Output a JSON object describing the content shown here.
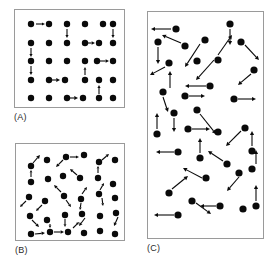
{
  "figure": {
    "kind": "vector-field-point-pattern-figure",
    "background_color": "#ffffff",
    "dot_color": "#0a0a0a",
    "arrow_color": "#0a0a0a",
    "border_color": "#9a9a9a",
    "width": 274,
    "height": 268
  },
  "panels": [
    {
      "id": "A",
      "label": "(A)",
      "name": "panel-a-regular-lattice",
      "frame": {
        "x": 14,
        "y": 9,
        "w": 111,
        "h": 99
      },
      "label_pos": {
        "x": 14,
        "y": 112
      },
      "description": "regular square lattice of points with short axis-aligned arrows",
      "dot_radius": 3.2,
      "arrow_stroke": 1.1,
      "points": [
        {
          "x": 16,
          "y": 14
        },
        {
          "x": 34,
          "y": 14
        },
        {
          "x": 52,
          "y": 14
        },
        {
          "x": 70,
          "y": 14
        },
        {
          "x": 88,
          "y": 14
        },
        {
          "x": 98,
          "y": 14
        },
        {
          "x": 16,
          "y": 33
        },
        {
          "x": 34,
          "y": 33
        },
        {
          "x": 52,
          "y": 33
        },
        {
          "x": 70,
          "y": 33
        },
        {
          "x": 84,
          "y": 33
        },
        {
          "x": 98,
          "y": 33
        },
        {
          "x": 16,
          "y": 51
        },
        {
          "x": 34,
          "y": 51
        },
        {
          "x": 52,
          "y": 51
        },
        {
          "x": 70,
          "y": 51
        },
        {
          "x": 82,
          "y": 51
        },
        {
          "x": 98,
          "y": 51
        },
        {
          "x": 16,
          "y": 70
        },
        {
          "x": 34,
          "y": 70
        },
        {
          "x": 50,
          "y": 70
        },
        {
          "x": 70,
          "y": 70
        },
        {
          "x": 84,
          "y": 70
        },
        {
          "x": 98,
          "y": 70
        },
        {
          "x": 16,
          "y": 88
        },
        {
          "x": 34,
          "y": 88
        },
        {
          "x": 52,
          "y": 88
        },
        {
          "x": 68,
          "y": 88
        },
        {
          "x": 84,
          "y": 88
        },
        {
          "x": 98,
          "y": 88
        }
      ],
      "arrows": [
        {
          "x1": 21,
          "y1": 14,
          "x2": 30,
          "y2": 14
        },
        {
          "x1": 52,
          "y1": 19,
          "x2": 52,
          "y2": 28
        },
        {
          "x1": 98,
          "y1": 19,
          "x2": 98,
          "y2": 28
        },
        {
          "x1": 70,
          "y1": 33,
          "x2": 80,
          "y2": 33
        },
        {
          "x1": 16,
          "y1": 38,
          "x2": 16,
          "y2": 47
        },
        {
          "x1": 84,
          "y1": 51,
          "x2": 94,
          "y2": 51
        },
        {
          "x1": 16,
          "y1": 56,
          "x2": 16,
          "y2": 65
        },
        {
          "x1": 70,
          "y1": 65,
          "x2": 70,
          "y2": 57
        },
        {
          "x1": 34,
          "y1": 70,
          "x2": 45,
          "y2": 70
        },
        {
          "x1": 84,
          "y1": 84,
          "x2": 84,
          "y2": 75
        },
        {
          "x1": 52,
          "y1": 88,
          "x2": 63,
          "y2": 88
        }
      ]
    },
    {
      "id": "B",
      "label": "(B)",
      "name": "panel-b-perturbed-lattice",
      "frame": {
        "x": 15,
        "y": 143,
        "w": 110,
        "h": 98
      },
      "label_pos": {
        "x": 15,
        "y": 245
      },
      "description": "jittered lattice of points with short arrows at varied angles",
      "dot_radius": 3.2,
      "arrow_stroke": 1.1,
      "points": [
        {
          "x": 15,
          "y": 22
        },
        {
          "x": 31,
          "y": 16
        },
        {
          "x": 50,
          "y": 13
        },
        {
          "x": 68,
          "y": 11
        },
        {
          "x": 83,
          "y": 18
        },
        {
          "x": 99,
          "y": 16
        },
        {
          "x": 15,
          "y": 38
        },
        {
          "x": 32,
          "y": 35
        },
        {
          "x": 47,
          "y": 32
        },
        {
          "x": 64,
          "y": 34
        },
        {
          "x": 82,
          "y": 34
        },
        {
          "x": 97,
          "y": 40
        },
        {
          "x": 13,
          "y": 53
        },
        {
          "x": 29,
          "y": 57
        },
        {
          "x": 48,
          "y": 52
        },
        {
          "x": 65,
          "y": 55
        },
        {
          "x": 83,
          "y": 50
        },
        {
          "x": 99,
          "y": 54
        },
        {
          "x": 14,
          "y": 72
        },
        {
          "x": 31,
          "y": 76
        },
        {
          "x": 49,
          "y": 71
        },
        {
          "x": 66,
          "y": 70
        },
        {
          "x": 84,
          "y": 72
        },
        {
          "x": 100,
          "y": 69
        },
        {
          "x": 15,
          "y": 90
        },
        {
          "x": 34,
          "y": 88
        },
        {
          "x": 52,
          "y": 88
        },
        {
          "x": 68,
          "y": 89
        },
        {
          "x": 84,
          "y": 87
        },
        {
          "x": 99,
          "y": 90
        }
      ],
      "arrows": [
        {
          "x1": 17,
          "y1": 19,
          "x2": 24,
          "y2": 11
        },
        {
          "x1": 47,
          "y1": 16,
          "x2": 40,
          "y2": 23
        },
        {
          "x1": 54,
          "y1": 13,
          "x2": 63,
          "y2": 13
        },
        {
          "x1": 86,
          "y1": 16,
          "x2": 93,
          "y2": 10
        },
        {
          "x1": 15,
          "y1": 33,
          "x2": 15,
          "y2": 26
        },
        {
          "x1": 61,
          "y1": 31,
          "x2": 54,
          "y2": 25
        },
        {
          "x1": 82,
          "y1": 29,
          "x2": 82,
          "y2": 22
        },
        {
          "x1": 45,
          "y1": 48,
          "x2": 38,
          "y2": 41
        },
        {
          "x1": 66,
          "y1": 50,
          "x2": 71,
          "y2": 43
        },
        {
          "x1": 10,
          "y1": 57,
          "x2": 4,
          "y2": 63
        },
        {
          "x1": 84,
          "y1": 46,
          "x2": 88,
          "y2": 39
        },
        {
          "x1": 26,
          "y1": 61,
          "x2": 20,
          "y2": 67
        },
        {
          "x1": 50,
          "y1": 56,
          "x2": 55,
          "y2": 63
        },
        {
          "x1": 65,
          "y1": 59,
          "x2": 64,
          "y2": 66
        },
        {
          "x1": 86,
          "y1": 54,
          "x2": 87,
          "y2": 62
        },
        {
          "x1": 16,
          "y1": 76,
          "x2": 23,
          "y2": 83
        },
        {
          "x1": 34,
          "y1": 80,
          "x2": 34,
          "y2": 84
        },
        {
          "x1": 49,
          "y1": 75,
          "x2": 49,
          "y2": 83
        },
        {
          "x1": 69,
          "y1": 74,
          "x2": 63,
          "y2": 82
        },
        {
          "x1": 102,
          "y1": 73,
          "x2": 98,
          "y2": 82
        },
        {
          "x1": 19,
          "y1": 90,
          "x2": 29,
          "y2": 89
        },
        {
          "x1": 38,
          "y1": 88,
          "x2": 48,
          "y2": 88
        },
        {
          "x1": 57,
          "y1": 84,
          "x2": 63,
          "y2": 78
        }
      ]
    },
    {
      "id": "C",
      "label": "(C)",
      "name": "panel-c-random-pattern",
      "frame": {
        "x": 147,
        "y": 11,
        "w": 117,
        "h": 228
      },
      "label_pos": {
        "x": 147,
        "y": 243
      },
      "description": "completely random (Poisson) point pattern with long arrows at random orientations",
      "dot_radius": 3.6,
      "arrow_stroke": 1.1,
      "points": [
        {
          "x": 28,
          "y": 17
        },
        {
          "x": 82,
          "y": 12
        },
        {
          "x": 10,
          "y": 30
        },
        {
          "x": 57,
          "y": 28
        },
        {
          "x": 37,
          "y": 34
        },
        {
          "x": 93,
          "y": 30
        },
        {
          "x": 21,
          "y": 51
        },
        {
          "x": 49,
          "y": 49
        },
        {
          "x": 70,
          "y": 48
        },
        {
          "x": 106,
          "y": 58
        },
        {
          "x": 15,
          "y": 80
        },
        {
          "x": 62,
          "y": 74
        },
        {
          "x": 37,
          "y": 84
        },
        {
          "x": 86,
          "y": 87
        },
        {
          "x": 26,
          "y": 101
        },
        {
          "x": 49,
          "y": 98
        },
        {
          "x": 9,
          "y": 122
        },
        {
          "x": 40,
          "y": 117
        },
        {
          "x": 70,
          "y": 120
        },
        {
          "x": 97,
          "y": 116
        },
        {
          "x": 30,
          "y": 140
        },
        {
          "x": 104,
          "y": 139
        },
        {
          "x": 52,
          "y": 146
        },
        {
          "x": 79,
          "y": 152
        },
        {
          "x": 58,
          "y": 166
        },
        {
          "x": 91,
          "y": 161
        },
        {
          "x": 104,
          "y": 157
        },
        {
          "x": 21,
          "y": 181
        },
        {
          "x": 44,
          "y": 189
        },
        {
          "x": 72,
          "y": 194
        },
        {
          "x": 95,
          "y": 197
        },
        {
          "x": 108,
          "y": 194
        },
        {
          "x": 30,
          "y": 203
        }
      ],
      "arrows": [
        {
          "x1": 23,
          "y1": 17,
          "x2": 3,
          "y2": 17
        },
        {
          "x1": 82,
          "y1": 17,
          "x2": 82,
          "y2": 33
        },
        {
          "x1": 33,
          "y1": 31,
          "x2": 14,
          "y2": 23
        },
        {
          "x1": 70,
          "y1": 43,
          "x2": 84,
          "y2": 23
        },
        {
          "x1": 10,
          "y1": 35,
          "x2": 10,
          "y2": 52
        },
        {
          "x1": 97,
          "y1": 33,
          "x2": 111,
          "y2": 48
        },
        {
          "x1": 52,
          "y1": 32,
          "x2": 37,
          "y2": 55
        },
        {
          "x1": 17,
          "y1": 55,
          "x2": 2,
          "y2": 63
        },
        {
          "x1": 66,
          "y1": 48,
          "x2": 48,
          "y2": 68
        },
        {
          "x1": 22,
          "y1": 76,
          "x2": 22,
          "y2": 59
        },
        {
          "x1": 58,
          "y1": 74,
          "x2": 37,
          "y2": 74
        },
        {
          "x1": 103,
          "y1": 62,
          "x2": 90,
          "y2": 73
        },
        {
          "x1": 41,
          "y1": 84,
          "x2": 57,
          "y2": 84
        },
        {
          "x1": 15,
          "y1": 85,
          "x2": 20,
          "y2": 100
        },
        {
          "x1": 90,
          "y1": 87,
          "x2": 108,
          "y2": 87
        },
        {
          "x1": 26,
          "y1": 106,
          "x2": 26,
          "y2": 120
        },
        {
          "x1": 52,
          "y1": 102,
          "x2": 68,
          "y2": 122
        },
        {
          "x1": 9,
          "y1": 117,
          "x2": 9,
          "y2": 101
        },
        {
          "x1": 44,
          "y1": 117,
          "x2": 62,
          "y2": 117
        },
        {
          "x1": 93,
          "y1": 119,
          "x2": 78,
          "y2": 134
        },
        {
          "x1": 104,
          "y1": 134,
          "x2": 104,
          "y2": 119
        },
        {
          "x1": 26,
          "y1": 140,
          "x2": 8,
          "y2": 140
        },
        {
          "x1": 52,
          "y1": 141,
          "x2": 52,
          "y2": 126
        },
        {
          "x1": 75,
          "y1": 149,
          "x2": 60,
          "y2": 139
        },
        {
          "x1": 54,
          "y1": 166,
          "x2": 35,
          "y2": 156
        },
        {
          "x1": 91,
          "y1": 165,
          "x2": 79,
          "y2": 179
        },
        {
          "x1": 108,
          "y1": 152,
          "x2": 108,
          "y2": 138
        },
        {
          "x1": 24,
          "y1": 177,
          "x2": 40,
          "y2": 164
        },
        {
          "x1": 48,
          "y1": 191,
          "x2": 63,
          "y2": 202
        },
        {
          "x1": 68,
          "y1": 194,
          "x2": 52,
          "y2": 194
        },
        {
          "x1": 108,
          "y1": 189,
          "x2": 108,
          "y2": 173
        },
        {
          "x1": 26,
          "y1": 203,
          "x2": 6,
          "y2": 203
        }
      ]
    }
  ]
}
